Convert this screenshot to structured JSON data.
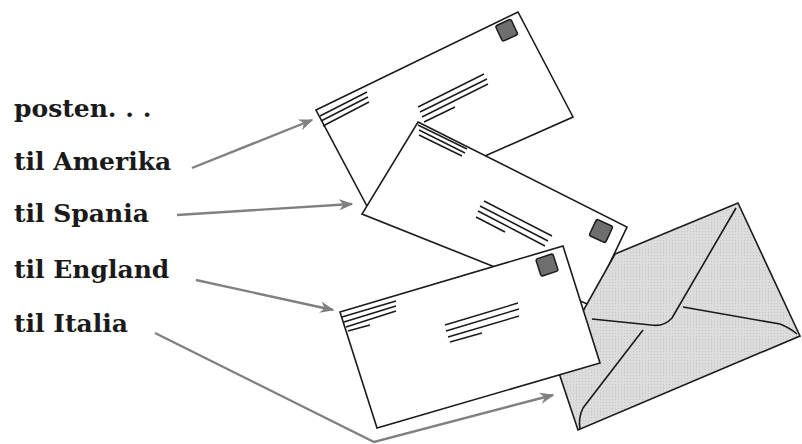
{
  "illustration": {
    "labels": [
      {
        "text": "posten. . .",
        "top": 94
      },
      {
        "text": "til Amerika",
        "top": 147
      },
      {
        "text": "til Spania",
        "top": 199
      },
      {
        "text": "til England",
        "top": 255
      },
      {
        "text": "til Italia",
        "top": 309
      }
    ],
    "arrow_color": "#808080",
    "line_color": "#1a1a1a",
    "stamp_color": "#6e6e6e",
    "grey_envelope_fill": "#d9d9d9",
    "icons": [
      "letter-envelope-icon",
      "arrow-icon",
      "stamp-icon",
      "closed-envelope-back-icon"
    ]
  }
}
